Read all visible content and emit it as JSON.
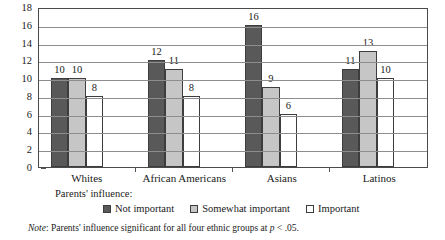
{
  "chart_data": {
    "type": "bar",
    "title": "",
    "subtitle": "",
    "xlabel": "",
    "ylabel": "",
    "ylim": [
      0,
      18
    ],
    "ytick_step": 2,
    "yticks": [
      18,
      16,
      14,
      12,
      10,
      8,
      6,
      4,
      2,
      0
    ],
    "grid": true,
    "legend_position": "bottom",
    "legend_title": "Parents' influence:",
    "categories": [
      "Whites",
      "African Americans",
      "Asians",
      "Latinos"
    ],
    "series": [
      {
        "name": "Not important",
        "color": "#595959",
        "values": [
          10,
          12,
          16,
          11
        ]
      },
      {
        "name": "Somewhat important",
        "color": "#c6c6c6",
        "values": [
          10,
          11,
          9,
          13
        ]
      },
      {
        "name": "Important",
        "color": "#ffffff",
        "values": [
          8,
          8,
          6,
          10
        ]
      }
    ],
    "annotations": {
      "note_prefix": "Note",
      "note_text": ": Parents' influence significant for all four ethnic groups at ",
      "note_stat": "p",
      "note_tail": " < .05."
    }
  },
  "colors": {
    "not_important": "#595959",
    "somewhat_important": "#c6c6c6",
    "important": "#ffffff",
    "axis": "#4a4a4a",
    "gridline": "#8d8d8d",
    "text": "#1a1a1a"
  }
}
